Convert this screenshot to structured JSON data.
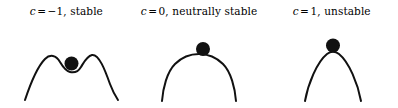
{
  "figure": {
    "name": "stability-of-equilibrium-potential-curves",
    "background_color": "#ffffff",
    "ink_color": "#111111",
    "panel_count": 3
  },
  "panels": [
    {
      "id": "panel-1",
      "caption": {
        "full": "c = −1, stable",
        "variable": "c",
        "operator": "=",
        "value": "−1,",
        "description": "stable"
      },
      "curve": {
        "name": "double-hump-curve",
        "shape": "double-hump",
        "path": "M 25 78 C 31 60, 38 44, 45 37 C 50 32, 56 33, 60 40 C 63 45, 66 49, 70 50 C 74 51, 78 50, 81 45 C 84 40, 87 34, 92 33 C 99 32, 105 48, 110 62 C 113 70, 116 75, 118 78",
        "stroke_width": 2
      },
      "ball": {
        "name": "ball",
        "cx": 71.5,
        "cy": 41.5,
        "r": 7.0
      }
    },
    {
      "id": "panel-2",
      "caption": {
        "full": "c = 0, neutrally stable",
        "variable": "c",
        "operator": "=",
        "value": "0,",
        "description": "neutrally stable"
      },
      "curve": {
        "name": "flat-top-dome-curve",
        "shape": "flat-topped-dome",
        "path": "M 29 79 C 30 66, 34 50, 42 42 C 50 34, 58 32, 66 32 C 74 32, 82 34, 90 42 C 98 50, 102 66, 103 79",
        "stroke_width": 2
      },
      "ball": {
        "name": "ball",
        "cx": 70.0,
        "cy": 27.0,
        "r": 7.0
      }
    },
    {
      "id": "panel-3",
      "caption": {
        "full": "c = 1, unstable",
        "variable": "c",
        "operator": "=",
        "value": "1,",
        "description": "unstable"
      },
      "curve": {
        "name": "parabolic-dome-curve",
        "shape": "parabolic-dome",
        "path": "M 40 79 C 43 62, 52 40, 62 32 C 66 29, 70 29, 74 32 C 84 40, 93 62, 96 79",
        "stroke_width": 2
      },
      "ball": {
        "name": "ball",
        "cx": 68.0,
        "cy": 23.5,
        "r": 7.0
      }
    }
  ],
  "chart_data": {
    "type": "line",
    "title": "",
    "xlabel": "",
    "ylabel": "",
    "grid": false,
    "legend": "none",
    "series": [
      {
        "name": "c = -1, stable",
        "shape": "double-hump (local minimum at center flanked by two maxima)",
        "ball_position": "in central dip (stable)",
        "x": [
          -1.0,
          -0.8,
          -0.6,
          -0.4,
          -0.2,
          0.0,
          0.2,
          0.4,
          0.6,
          0.8,
          1.0
        ],
        "values": [
          -0.4,
          0.35,
          0.75,
          0.85,
          0.72,
          0.66,
          0.72,
          0.85,
          0.75,
          0.35,
          -0.4
        ]
      },
      {
        "name": "c = 0, neutrally stable",
        "shape": "flat-topped dome (quartic maximum)",
        "ball_position": "on flat summit (neutrally stable)",
        "x": [
          -1.0,
          -0.8,
          -0.6,
          -0.4,
          -0.2,
          0.0,
          0.2,
          0.4,
          0.6,
          0.8,
          1.0
        ],
        "values": [
          -0.45,
          0.25,
          0.7,
          0.9,
          0.98,
          1.0,
          0.98,
          0.9,
          0.7,
          0.25,
          -0.45
        ]
      },
      {
        "name": "c = 1, unstable",
        "shape": "parabolic dome (quadratic maximum)",
        "ball_position": "balanced on peak (unstable)",
        "x": [
          -1.0,
          -0.8,
          -0.6,
          -0.4,
          -0.2,
          0.0,
          0.2,
          0.4,
          0.6,
          0.8,
          1.0
        ],
        "values": [
          -0.5,
          0.0,
          0.4,
          0.72,
          0.93,
          1.0,
          0.93,
          0.72,
          0.4,
          0.0,
          -0.5
        ]
      }
    ]
  }
}
